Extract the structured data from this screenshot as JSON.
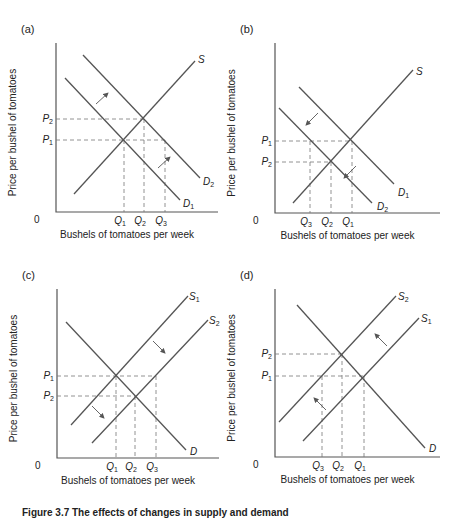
{
  "caption": "Figure 3.7 The effects of changes in supply and demand",
  "axis_titles": {
    "y": "Price per bushel of tomatoes",
    "x": "Bushels of tomatoes per week",
    "origin": "0"
  },
  "chart_data": [
    {
      "type": "line",
      "panel": "(a)",
      "title": "(a)",
      "description": "Demand increases (D1 shifts right to D2); price rises P1 to P2, quantity rises Q1 to Q2",
      "xlabel": "Bushels of tomatoes per week",
      "ylabel": "Price per bushel of tomatoes",
      "origin": {
        "x": 56,
        "y": 212
      },
      "y_axis_top": 43,
      "x_axis_right": 218,
      "series": [
        {
          "name": "S",
          "label": "S",
          "sub": "",
          "points": [
            [
              74,
              194
            ],
            [
              195,
              61
            ]
          ],
          "label_pos": [
            198,
            63
          ]
        },
        {
          "name": "D1",
          "label": "D",
          "sub": "1",
          "points": [
            [
              65,
              78
            ],
            [
              180,
              200
            ]
          ],
          "label_pos": [
            183,
            207
          ]
        },
        {
          "name": "D2",
          "label": "D",
          "sub": "2",
          "points": [
            [
              83,
              55
            ],
            [
              200,
              178
            ]
          ],
          "label_pos": [
            203,
            185
          ]
        }
      ],
      "price_levels": [
        {
          "label": "P",
          "sub": "2",
          "y": 119,
          "x_end": 144
        },
        {
          "label": "P",
          "sub": "1",
          "y": 140,
          "x_end": 165
        }
      ],
      "quantity_levels": [
        {
          "label": "Q",
          "sub": "1",
          "x": 124,
          "y_top": 140
        },
        {
          "label": "Q",
          "sub": "2",
          "x": 144,
          "y_top": 119
        },
        {
          "label": "Q",
          "sub": "3",
          "x": 165,
          "y_top": 140
        }
      ],
      "shift_arrows": [
        [
          [
            96,
            104
          ],
          [
            108,
            93
          ]
        ],
        [
          [
            158,
            168
          ],
          [
            170,
            157
          ]
        ]
      ]
    },
    {
      "type": "line",
      "panel": "(b)",
      "title": "(b)",
      "description": "Demand decreases (D1 shifts left to D2); price falls P1 to P2, quantity falls Q1 to Q2",
      "xlabel": "Bushels of tomatoes per week",
      "ylabel": "Price per bushel of tomatoes",
      "origin": {
        "x": 275,
        "y": 213
      },
      "y_axis_top": 43,
      "x_axis_right": 440,
      "series": [
        {
          "name": "S",
          "label": "S",
          "sub": "",
          "points": [
            [
              293,
              203
            ],
            [
              413,
              70
            ]
          ],
          "label_pos": [
            416,
            75
          ]
        },
        {
          "name": "D1",
          "label": "D",
          "sub": "1",
          "points": [
            [
              299,
              87
            ],
            [
              394,
              184
            ]
          ],
          "label_pos": [
            398,
            196
          ]
        },
        {
          "name": "D2",
          "label": "D",
          "sub": "2",
          "points": [
            [
              279,
              108
            ],
            [
              372,
              203
            ]
          ],
          "label_pos": [
            377,
            210
          ]
        }
      ],
      "price_levels": [
        {
          "label": "P",
          "sub": "1",
          "y": 141,
          "x_end": 352
        },
        {
          "label": "P",
          "sub": "2",
          "y": 162,
          "x_end": 331
        }
      ],
      "quantity_levels": [
        {
          "label": "Q",
          "sub": "3",
          "x": 310,
          "y_top": 141
        },
        {
          "label": "Q",
          "sub": "2",
          "x": 331,
          "y_top": 162
        },
        {
          "label": "Q",
          "sub": "1",
          "x": 352,
          "y_top": 141
        }
      ],
      "shift_arrows": [
        [
          [
            318,
            113
          ],
          [
            306,
            125
          ]
        ],
        [
          [
            356,
            166
          ],
          [
            344,
            178
          ]
        ]
      ]
    },
    {
      "type": "line",
      "panel": "(c)",
      "title": "(c)",
      "description": "Supply increases (S1 shifts right to S2); price falls P1 to P2, quantity rises Q1 to Q2",
      "xlabel": "Bushels of tomatoes per week",
      "ylabel": "Price per bushel of tomatoes",
      "origin": {
        "x": 57,
        "y": 458
      },
      "y_axis_top": 289,
      "x_axis_right": 219,
      "series": [
        {
          "name": "S1",
          "label": "S",
          "sub": "1",
          "points": [
            [
              71,
              425
            ],
            [
              188,
              296
            ]
          ],
          "label_pos": [
            189,
            300
          ]
        },
        {
          "name": "S2",
          "label": "S",
          "sub": "2",
          "points": [
            [
              92,
              443
            ],
            [
              208,
              320
            ]
          ],
          "label_pos": [
            209,
            324
          ]
        },
        {
          "name": "D",
          "label": "D",
          "sub": "",
          "points": [
            [
              66,
              322
            ],
            [
              186,
              450
            ]
          ],
          "label_pos": [
            190,
            455
          ]
        }
      ],
      "price_levels": [
        {
          "label": "P",
          "sub": "1",
          "y": 376,
          "x_end": 156
        },
        {
          "label": "P",
          "sub": "2",
          "y": 396,
          "x_end": 135
        }
      ],
      "quantity_levels": [
        {
          "label": "Q",
          "sub": "1",
          "x": 116,
          "y_top": 376
        },
        {
          "label": "Q",
          "sub": "2",
          "x": 135,
          "y_top": 396
        },
        {
          "label": "Q",
          "sub": "3",
          "x": 156,
          "y_top": 376
        }
      ],
      "shift_arrows": [
        [
          [
            153,
            341
          ],
          [
            165,
            353
          ]
        ],
        [
          [
            92,
            406
          ],
          [
            104,
            418
          ]
        ]
      ]
    },
    {
      "type": "line",
      "panel": "(d)",
      "title": "(d)",
      "description": "Supply decreases (S1 shifts left to S2); price rises P1 to P2, quantity falls Q1 to Q2",
      "xlabel": "Bushels of tomatoes per week",
      "ylabel": "Price per bushel of tomatoes",
      "origin": {
        "x": 275,
        "y": 457
      },
      "y_axis_top": 289,
      "x_axis_right": 440,
      "series": [
        {
          "name": "S2",
          "label": "S",
          "sub": "2",
          "points": [
            [
              279,
              422
            ],
            [
              396,
              296
            ]
          ],
          "label_pos": [
            398,
            300
          ]
        },
        {
          "name": "S1",
          "label": "S",
          "sub": "1",
          "points": [
            [
              303,
              441
            ],
            [
              419,
              318
            ]
          ],
          "label_pos": [
            421,
            322
          ]
        },
        {
          "name": "D",
          "label": "D",
          "sub": "",
          "points": [
            [
              297,
              305
            ],
            [
              425,
              448
            ]
          ],
          "label_pos": [
            429,
            452
          ]
        }
      ],
      "price_levels": [
        {
          "label": "P",
          "sub": "2",
          "y": 354,
          "x_end": 342
        },
        {
          "label": "P",
          "sub": "1",
          "y": 376,
          "x_end": 364
        }
      ],
      "quantity_levels": [
        {
          "label": "Q",
          "sub": "3",
          "x": 322,
          "y_top": 376
        },
        {
          "label": "Q",
          "sub": "2",
          "x": 342,
          "y_top": 354
        },
        {
          "label": "Q",
          "sub": "1",
          "x": 364,
          "y_top": 376
        }
      ],
      "shift_arrows": [
        [
          [
            387,
            346
          ],
          [
            375,
            334
          ]
        ],
        [
          [
            326,
            410
          ],
          [
            314,
            398
          ]
        ]
      ]
    }
  ]
}
